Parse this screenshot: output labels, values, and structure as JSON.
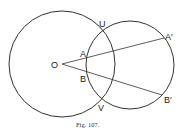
{
  "figure": {
    "caption": "Fig. 107.",
    "points": {
      "O": "O",
      "A": "A",
      "B": "B",
      "U": "U",
      "V": "V",
      "A_prime": "A′",
      "B_prime": "B′"
    },
    "circles": [
      {
        "name": "circle-O",
        "cx": 62,
        "cy": 64,
        "r": 53
      },
      {
        "name": "circle-2",
        "cx": 130,
        "cy": 65,
        "r": 44
      }
    ],
    "lines": [
      {
        "name": "line-OA-prime",
        "x1": 62,
        "y1": 64,
        "x2": 164,
        "y2": 38
      },
      {
        "name": "line-OB-prime",
        "x1": 62,
        "y1": 64,
        "x2": 162,
        "y2": 95
      }
    ],
    "stroke_color": "#333333"
  }
}
